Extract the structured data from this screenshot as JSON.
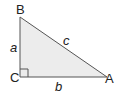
{
  "diagram": {
    "type": "right-triangle",
    "fill_color": "#ececec",
    "stroke_color": "#555555",
    "vertices": [
      {
        "id": "B",
        "label": "B",
        "x": 20,
        "y": 17
      },
      {
        "id": "C",
        "label": "C",
        "x": 20,
        "y": 77
      },
      {
        "id": "A",
        "label": "A",
        "x": 107,
        "y": 77
      }
    ],
    "sides": [
      {
        "id": "a",
        "label": "a",
        "between": "B-C"
      },
      {
        "id": "b",
        "label": "b",
        "between": "C-A"
      },
      {
        "id": "c",
        "label": "c",
        "between": "B-A"
      }
    ],
    "right_angle_at": "C"
  }
}
